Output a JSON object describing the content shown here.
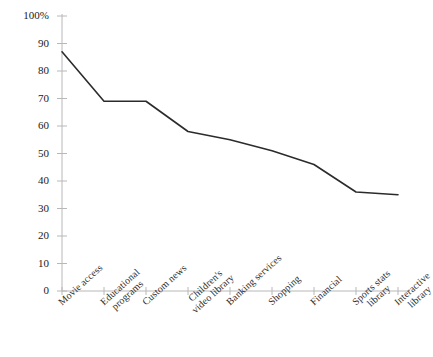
{
  "chart_data": {
    "type": "line",
    "title": "",
    "subtitle": "",
    "xlabel": "",
    "ylabel": "",
    "ylim": [
      0,
      100
    ],
    "grid": false,
    "legend": false,
    "legend_position": "none",
    "line_color": "#2b2b2b",
    "axis_color": "#b8b8b8",
    "categories": [
      "Movie access",
      "Educational programs",
      "Custom news",
      "Children's video library",
      "Banking services",
      "Shopping",
      "Financial",
      "Sports stats library",
      "Interactive library"
    ],
    "category_lines": [
      [
        "Movie access"
      ],
      [
        "Educational",
        "programs"
      ],
      [
        "Custom news"
      ],
      [
        "Children's",
        "video library"
      ],
      [
        "Banking services"
      ],
      [
        "Shopping"
      ],
      [
        "Financial"
      ],
      [
        "Sports stats",
        "library"
      ],
      [
        "Interactive",
        "library"
      ]
    ],
    "values": [
      87,
      69,
      69,
      58,
      55,
      51,
      46,
      36,
      35
    ],
    "ytick_labels": [
      "100%",
      "90",
      "80",
      "70",
      "60",
      "50",
      "40",
      "30",
      "20",
      "10",
      "0"
    ],
    "ytick_values": [
      100,
      90,
      80,
      70,
      60,
      50,
      40,
      30,
      20,
      10,
      0
    ]
  }
}
